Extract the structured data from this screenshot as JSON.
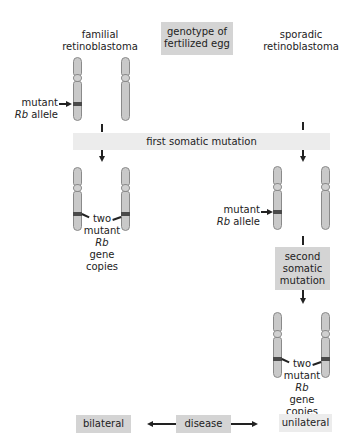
{
  "header": {
    "familial_line1": "familial",
    "familial_line2": "retinoblastoma",
    "genotype_line1": "genotype of",
    "genotype_line2": "fertilized egg",
    "sporadic_line1": "sporadic",
    "sporadic_line2": "retinoblastoma"
  },
  "labels": {
    "mutant_allele_left_word": "mutant",
    "mutant_allele_left_gene": "Rb",
    "mutant_allele_left_rest": "allele",
    "first_somatic": "first somatic mutation",
    "two_mutant_left": [
      "two",
      "mutant",
      "Rb",
      "gene",
      "copies"
    ],
    "mutant_allele_right_word": "mutant",
    "mutant_allele_right_gene": "Rb",
    "mutant_allele_right_rest": "allele",
    "second_somatic_line1": "second",
    "second_somatic_line2": "somatic",
    "second_somatic_line3": "mutation",
    "two_mutant_right": [
      "two",
      "mutant",
      "Rb",
      "gene",
      "copies"
    ]
  },
  "footer": {
    "bilateral": "bilateral",
    "disease": "disease",
    "unilateral": "unilateral"
  },
  "colors": {
    "box_dark": "#d4d4d4",
    "box_light": "#ececec",
    "chromosome": "#c9c9c9",
    "mutant_band": "#4a4a4a"
  }
}
